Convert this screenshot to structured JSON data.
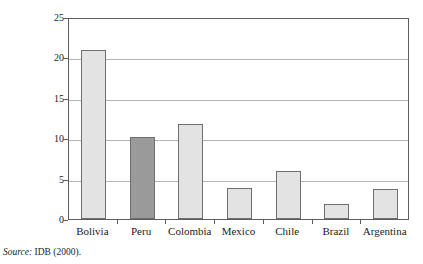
{
  "chart_data": {
    "type": "bar",
    "title": "",
    "xlabel": "",
    "ylabel": "Percent of GDP",
    "ylim": [
      0,
      25
    ],
    "ytick_step": 5,
    "yticks": [
      "0",
      "5",
      "10",
      "15",
      "20",
      "25"
    ],
    "grid": true,
    "legend": "none",
    "categories": [
      "Bolivia",
      "Peru",
      "Colombia",
      "Mexico",
      "Chile",
      "Brazil",
      "Argentina"
    ],
    "values": [
      20.9,
      10.2,
      11.8,
      3.9,
      5.9,
      1.8,
      3.7
    ],
    "highlight_category": "Peru",
    "colors": {
      "bar_fill": "#e3e3e3",
      "bar_fill_highlight": "#9a9a9a",
      "bar_border": "#6e6e6e",
      "gridline": "#b3b3b3",
      "frame": "#5d5d5d",
      "text": "#1c1c1c",
      "background": "#ffffff"
    }
  },
  "source": {
    "label": "Source:",
    "text": "IDB (2000)."
  }
}
